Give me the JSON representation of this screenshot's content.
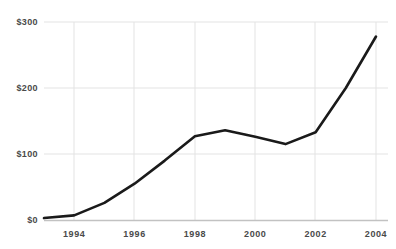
{
  "chart_data": {
    "type": "line",
    "title": "",
    "xlabel": "",
    "ylabel": "",
    "x": [
      1993,
      1994,
      1995,
      1996,
      1997,
      1998,
      1999,
      2000,
      2001,
      2002,
      2003,
      2004
    ],
    "values": [
      3,
      7,
      26,
      55,
      90,
      127,
      136,
      126,
      115,
      133,
      200,
      278
    ],
    "series": [
      {
        "name": "value",
        "values": [
          3,
          7,
          26,
          55,
          90,
          127,
          136,
          126,
          115,
          133,
          200,
          278
        ]
      }
    ],
    "xlim": [
      1993,
      2004
    ],
    "ylim": [
      0,
      300
    ],
    "ytick_values": [
      0,
      100,
      200,
      300
    ],
    "ytick_labels": [
      "$0",
      "$100",
      "$200",
      "$300"
    ],
    "xtick_values": [
      1994,
      1996,
      1998,
      2000,
      2002,
      2004
    ],
    "xtick_labels": [
      "1994",
      "1996",
      "1998",
      "2000",
      "2002",
      "2004"
    ],
    "grid": true,
    "grid_axis": "both",
    "legend": false,
    "legend_position": "none",
    "line_color": "#1a1a1a",
    "line_width": 2.6,
    "grid_color": "#e3e3e3",
    "axis_color": "#c9c9c9",
    "tick_label_color": "#4a4a4a",
    "background_color": "#ffffff"
  }
}
